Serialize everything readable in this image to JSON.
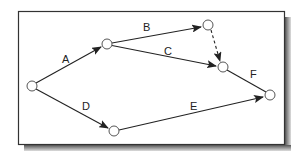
{
  "diagram": {
    "type": "activity-on-arrow network",
    "colors": {
      "frame": "#333333",
      "shadow": "#777777",
      "line": "#222222",
      "node_fill": "#ffffff",
      "node_stroke": "#555555"
    },
    "nodes": [
      {
        "id": "n1",
        "x": 32,
        "y": 86
      },
      {
        "id": "n2",
        "x": 107,
        "y": 44
      },
      {
        "id": "n3",
        "x": 208,
        "y": 25
      },
      {
        "id": "n4",
        "x": 223,
        "y": 67
      },
      {
        "id": "n5",
        "x": 270,
        "y": 95
      },
      {
        "id": "n6",
        "x": 114,
        "y": 131
      }
    ],
    "edges": [
      {
        "label": "A",
        "from": "n1",
        "to": "n2",
        "style": "solid",
        "arrow": true
      },
      {
        "label": "B",
        "from": "n2",
        "to": "n3",
        "style": "solid",
        "arrow": true
      },
      {
        "label": "C",
        "from": "n2",
        "to": "n4",
        "style": "solid",
        "arrow": true
      },
      {
        "label": "",
        "from": "n3",
        "to": "n4",
        "style": "dashed",
        "arrow": true
      },
      {
        "label": "D",
        "from": "n1",
        "to": "n6",
        "style": "solid",
        "arrow": true
      },
      {
        "label": "E",
        "from": "n6",
        "to": "n5",
        "style": "solid",
        "arrow": true
      },
      {
        "label": "F",
        "from": "n4",
        "to": "n5",
        "style": "solid",
        "arrow": false
      }
    ],
    "labels": {
      "A": "A",
      "B": "B",
      "C": "C",
      "D": "D",
      "E": "E",
      "F": "F"
    }
  }
}
